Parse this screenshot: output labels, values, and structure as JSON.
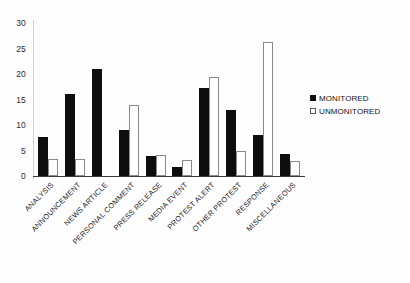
{
  "chart_data": {
    "type": "bar",
    "title": "",
    "xlabel": "",
    "ylabel": "",
    "ylim": [
      0,
      30
    ],
    "yticks": [
      0,
      5,
      10,
      15,
      20,
      25,
      30
    ],
    "grid": false,
    "legend_position": "right",
    "categories": [
      "ANALYSIS",
      "ANNOUNCEMENT",
      "NEWS ARTICLE",
      "PERSONAL COMMENT",
      "PRESS RELEASE",
      "MEDIA EVENT",
      "PROTEST ALERT",
      "OTHER PROTEST",
      "RESPONSE",
      "MISCELLANEOUS"
    ],
    "series": [
      {
        "name": "MONITORED",
        "color": "#0d0d0d",
        "style": "filled",
        "values": [
          7.6,
          16.0,
          21.0,
          9.0,
          4.0,
          1.8,
          17.3,
          13.0,
          8.0,
          4.4
        ]
      },
      {
        "name": "UNMONITORED",
        "color": "#ffffff",
        "style": "hollow",
        "values": [
          3.4,
          3.4,
          0.0,
          14.0,
          4.2,
          3.1,
          19.5,
          5.0,
          26.3,
          3.0
        ]
      }
    ]
  },
  "legend": {
    "items": [
      {
        "label": "MONITORED",
        "swatch": "filled-square"
      },
      {
        "label": "UNMONITORED",
        "swatch": "hollow-square"
      }
    ]
  }
}
